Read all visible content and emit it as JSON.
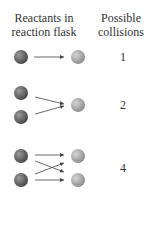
{
  "headers": {
    "left_line1": "Reactants in",
    "left_line2": "reaction flask",
    "right_line1": "Possible",
    "right_line2": "collisions"
  },
  "rows": [
    {
      "reactants_left": 1,
      "reactants_right": 1,
      "collisions": "1"
    },
    {
      "reactants_left": 2,
      "reactants_right": 1,
      "collisions": "2"
    },
    {
      "reactants_left": 2,
      "reactants_right": 2,
      "collisions": "4"
    }
  ],
  "colors": {
    "left_sphere": "#6a6a6a",
    "right_sphere": "#a8a8a8",
    "arrow": "#444444",
    "text": "#333333"
  }
}
